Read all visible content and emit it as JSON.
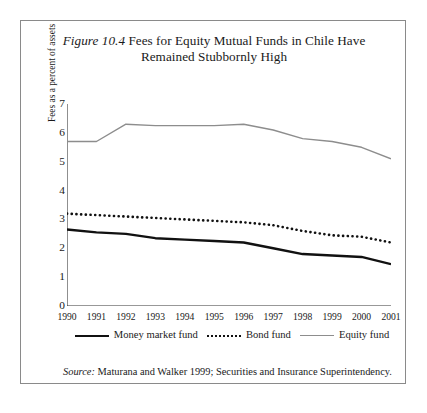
{
  "figure": {
    "number_label": "Figure 10.4",
    "title_rest": " Fees for Equity Mutual Funds in Chile Have Remained Stubbornly High",
    "source_label": "Source:",
    "source_text": " Maturana and Walker 1999; Securities and Insurance Superintendency."
  },
  "chart_data": {
    "type": "line",
    "title": "Figure 10.4 Fees for Equity Mutual Funds in Chile Have Remained Stubbornly High",
    "xlabel": "",
    "ylabel": "Fees as a percent of assets",
    "categories": [
      "1990",
      "1991",
      "1992",
      "1993",
      "1994",
      "1995",
      "1996",
      "1997",
      "1998",
      "1999",
      "2000",
      "2001"
    ],
    "x": [
      1990,
      1991,
      1992,
      1993,
      1994,
      1995,
      1996,
      1997,
      1998,
      1999,
      2000,
      2001
    ],
    "xlim": [
      1990,
      2001
    ],
    "ylim": [
      0,
      7
    ],
    "yticks": [
      0,
      1,
      2,
      3,
      4,
      5,
      6,
      7
    ],
    "ytick_labels": [
      "0",
      "1",
      "2",
      "3",
      "4",
      "5",
      "6",
      "7"
    ],
    "grid": false,
    "legend_position": "below",
    "series": [
      {
        "name": "Money market fund",
        "style": "solid",
        "color": "#111111",
        "values": [
          2.65,
          2.55,
          2.5,
          2.35,
          2.3,
          2.25,
          2.2,
          2.0,
          1.8,
          1.75,
          1.7,
          1.45
        ]
      },
      {
        "name": "Bond fund",
        "style": "dotted",
        "color": "#111111",
        "values": [
          3.2,
          3.15,
          3.1,
          3.05,
          3.0,
          2.95,
          2.9,
          2.8,
          2.6,
          2.45,
          2.4,
          2.2
        ]
      },
      {
        "name": "Equity fund",
        "style": "solid",
        "color": "#8d8d8d",
        "values": [
          5.7,
          5.7,
          6.3,
          6.25,
          6.25,
          6.25,
          6.3,
          6.1,
          5.8,
          5.7,
          5.5,
          5.1
        ]
      }
    ]
  },
  "colors": {
    "money_market": "#111111",
    "bond": "#111111",
    "equity": "#8d8d8d",
    "axis": "#333333",
    "border": "#8a8a8a"
  }
}
